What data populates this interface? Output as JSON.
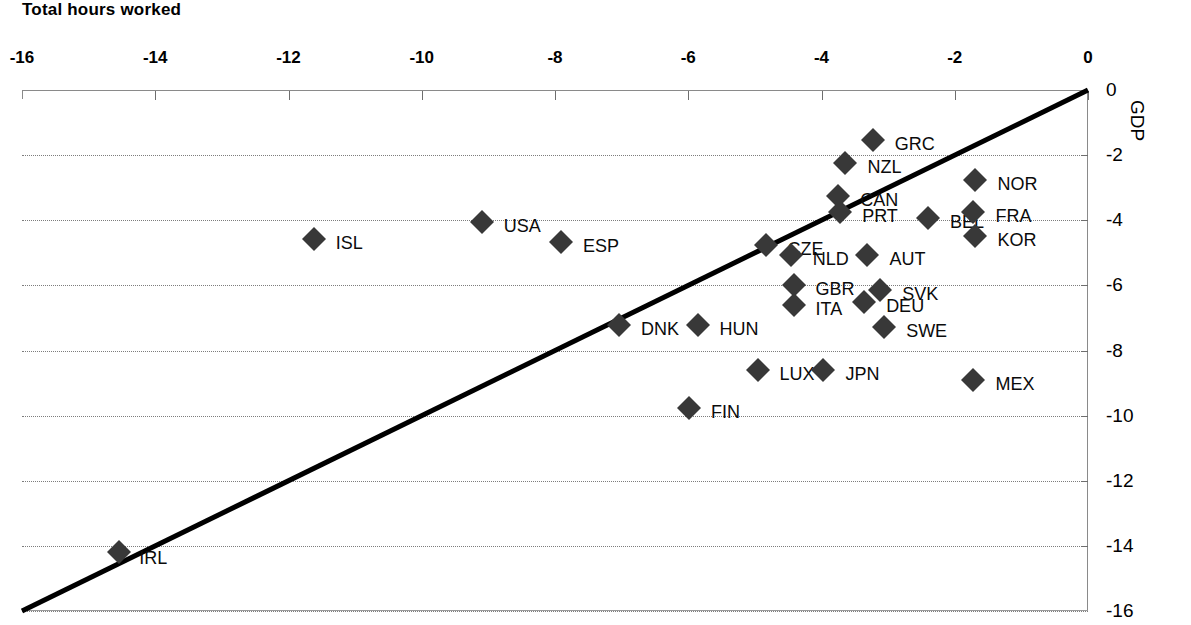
{
  "chart_data": {
    "type": "scatter",
    "title": "",
    "xlabel": "Total hours worked",
    "ylabel": "GDP",
    "xlim": [
      -16,
      0
    ],
    "ylim": [
      -16,
      0
    ],
    "xticks": [
      -16,
      -14,
      -12,
      -10,
      -8,
      -6,
      -4,
      -2,
      0
    ],
    "xtick_labels": [
      "-16",
      "-14",
      "-12",
      "-10",
      "-8",
      "-6",
      "-4",
      "-2",
      "0"
    ],
    "yticks": [
      0,
      -2,
      -4,
      -6,
      -8,
      -10,
      -12,
      -14,
      -16
    ],
    "ytick_labels": [
      "0",
      "-2",
      "-4",
      "-6",
      "-8",
      "-10",
      "-12",
      "-14",
      "-16"
    ],
    "grid": "horizontal-dotted",
    "legend": "none",
    "y_axis_side": "right",
    "x_axis_side": "top",
    "marker": "diamond",
    "marker_color": "#383838",
    "trendline": {
      "type": "line",
      "from": [
        -16,
        -16
      ],
      "to": [
        0,
        0
      ],
      "color": "#000000",
      "width": 5
    },
    "points": [
      {
        "label": "GRC",
        "x": -3.23,
        "y": -1.54,
        "label_dx": 22,
        "label_dy": 4
      },
      {
        "label": "NZL",
        "x": -3.64,
        "y": -2.24,
        "label_dx": 22,
        "label_dy": 4
      },
      {
        "label": "NOR",
        "x": -1.69,
        "y": -2.76,
        "label_dx": 22,
        "label_dy": 4
      },
      {
        "label": "CAN",
        "x": -3.75,
        "y": -3.26,
        "label_dx": 22,
        "label_dy": 4
      },
      {
        "label": "PRT",
        "x": -3.72,
        "y": -3.75,
        "label_dx": 22,
        "label_dy": 4
      },
      {
        "label": "BEL",
        "x": -2.4,
        "y": -3.93,
        "label_dx": 22,
        "label_dy": 4
      },
      {
        "label": "FRA",
        "x": -1.72,
        "y": -3.75,
        "label_dx": 22,
        "label_dy": 4
      },
      {
        "label": "KOR",
        "x": -1.69,
        "y": -4.48,
        "label_dx": 22,
        "label_dy": 4
      },
      {
        "label": "ISL",
        "x": -11.62,
        "y": -4.58,
        "label_dx": 22,
        "label_dy": 4
      },
      {
        "label": "USA",
        "x": -9.1,
        "y": -4.05,
        "label_dx": 22,
        "label_dy": 4
      },
      {
        "label": "ESP",
        "x": -7.91,
        "y": -4.67,
        "label_dx": 22,
        "label_dy": 4
      },
      {
        "label": "CZE",
        "x": -4.84,
        "y": -4.76,
        "label_dx": 22,
        "label_dy": 4
      },
      {
        "label": "NLD",
        "x": -4.46,
        "y": -5.07,
        "label_dx": 22,
        "label_dy": 4
      },
      {
        "label": "AUT",
        "x": -3.31,
        "y": -5.07,
        "label_dx": 22,
        "label_dy": 4
      },
      {
        "label": "GBR",
        "x": -4.42,
        "y": -5.99,
        "label_dx": 22,
        "label_dy": 4
      },
      {
        "label": "SVK",
        "x": -3.12,
        "y": -6.14,
        "label_dx": 22,
        "label_dy": 4
      },
      {
        "label": "DEU",
        "x": -3.36,
        "y": -6.51,
        "label_dx": 22,
        "label_dy": 4
      },
      {
        "label": "ITA",
        "x": -4.42,
        "y": -6.6,
        "label_dx": 22,
        "label_dy": 4
      },
      {
        "label": "DNK",
        "x": -7.04,
        "y": -7.22,
        "label_dx": 22,
        "label_dy": 4
      },
      {
        "label": "HUN",
        "x": -5.86,
        "y": -7.22,
        "label_dx": 22,
        "label_dy": 4
      },
      {
        "label": "SWE",
        "x": -3.06,
        "y": -7.28,
        "label_dx": 22,
        "label_dy": 4
      },
      {
        "label": "LUX",
        "x": -4.96,
        "y": -8.6,
        "label_dx": 22,
        "label_dy": 4
      },
      {
        "label": "JPN",
        "x": -3.97,
        "y": -8.6,
        "label_dx": 22,
        "label_dy": 4
      },
      {
        "label": "MEX",
        "x": -1.72,
        "y": -8.91,
        "label_dx": 22,
        "label_dy": 4
      },
      {
        "label": "FIN",
        "x": -5.99,
        "y": -9.77,
        "label_dx": 22,
        "label_dy": 4
      },
      {
        "label": "IRL",
        "x": -14.54,
        "y": -14.19,
        "label_dx": 20,
        "label_dy": 6
      }
    ]
  }
}
